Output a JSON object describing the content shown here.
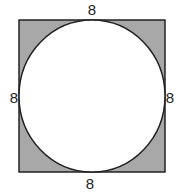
{
  "diagram": {
    "type": "geometry",
    "shapes": {
      "square": {
        "fill": "#a8a8a8",
        "stroke": "#222222"
      },
      "circle": {
        "fill": "#ffffff",
        "stroke": "#222222"
      }
    },
    "labels": {
      "top": "8",
      "left": "8",
      "right": "8",
      "bottom": "8"
    }
  }
}
